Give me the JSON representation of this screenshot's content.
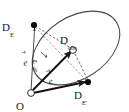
{
  "figure": {
    "caption_present": false,
    "points": [
      {
        "id": "D_E",
        "base": "D",
        "sub": "E",
        "x": 34,
        "y": 25,
        "marker": "filled-dot",
        "label_x": 2,
        "label_y": 18
      },
      {
        "id": "D_obs",
        "base": "D",
        "sub": "obs",
        "x": 73,
        "y": 50,
        "marker": "open-circle",
        "label_x": 60,
        "label_y": 31
      },
      {
        "id": "D_Eprime",
        "base": "D",
        "sub": "E′",
        "x": 88,
        "y": 82,
        "marker": "filled-dot",
        "label_x": 74,
        "label_y": 86
      },
      {
        "id": "O",
        "base": "O",
        "sub": "",
        "x": 31,
        "y": 93,
        "marker": "open-circle",
        "label_x": 16,
        "label_y": 97
      }
    ],
    "vectors": [
      {
        "id": "e",
        "base": "e",
        "sub": "",
        "overbar": "arrow",
        "from": "O",
        "to": "D_E",
        "label_x": 22,
        "label_y": 53,
        "rotation_deg": -8,
        "style": "solid"
      },
      {
        "id": "e_obs",
        "base": "e",
        "sub": "obs",
        "overbar": "arrow",
        "from": "O",
        "to": "D_obs",
        "label_x": 40,
        "label_y": 52,
        "rotation_deg": 40,
        "style": "solid-thick"
      },
      {
        "id": "e_prime",
        "base": "e",
        "sub": "′",
        "overbar": "arrow",
        "from": "O",
        "to": "D_Eprime",
        "label_x": 46,
        "label_y": 72,
        "rotation_deg": -16,
        "style": "solid-thick"
      }
    ],
    "connectors": [
      {
        "id": "DE-to-Dobs",
        "from": "D_E",
        "to": "D_obs",
        "style": "dashed"
      },
      {
        "id": "Dobs-to-DEp",
        "from": "D_obs",
        "to": "D_Eprime",
        "style": "dashed"
      },
      {
        "id": "DE-to-DEp",
        "from": "D_E",
        "to": "D_Eprime",
        "style": "dashed"
      }
    ],
    "ellipse": {
      "id": "orbit-ellipse",
      "center_x": 76,
      "center_y": 48,
      "radius_x": 48,
      "radius_y": 31,
      "rotation_deg": -33,
      "style": "solid"
    },
    "colors": {
      "ink": "#1a1a1a",
      "ellipse_stroke": "#4a4a4a",
      "dashed_stroke": "#555555",
      "background": "#ffffff"
    }
  }
}
